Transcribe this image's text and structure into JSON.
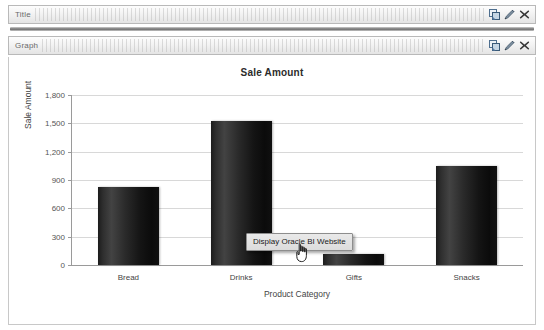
{
  "sections": [
    {
      "label": "Title",
      "icons": [
        {
          "name": "duplicate-icon",
          "title": "Duplicate"
        },
        {
          "name": "pencil-icon",
          "title": "Edit"
        },
        {
          "name": "close-icon",
          "title": "Delete"
        }
      ]
    },
    {
      "label": "Graph",
      "icons": [
        {
          "name": "duplicate-icon",
          "title": "Duplicate"
        },
        {
          "name": "pencil-icon",
          "title": "Edit"
        },
        {
          "name": "close-icon",
          "title": "Delete"
        }
      ]
    }
  ],
  "tooltip": {
    "text": "Display Oracle BI Website"
  },
  "colors": {
    "bar": "#1c1c1c",
    "gridline": "#d8d8d8",
    "axis": "#9a9a9a",
    "bar_header_border": "#b9b9b9",
    "tooltip_background": "#dcdcdc",
    "icon_blue": "#5b7fa6",
    "icon_dark": "#3a3a3a"
  },
  "chart_data": {
    "type": "bar",
    "title": "Sale Amount",
    "xlabel": "Product Category",
    "ylabel": "Sale Amount",
    "categories": [
      "Bread",
      "Drinks",
      "Gifts",
      "Snacks"
    ],
    "values": [
      830,
      1530,
      115,
      1050
    ],
    "ylim": [
      0,
      1800
    ],
    "yticks": [
      0,
      300,
      600,
      900,
      1200,
      1500,
      1800
    ],
    "ytick_labels": [
      "0",
      "300",
      "600",
      "900",
      "1,200",
      "1,500",
      "1,800"
    ],
    "grid": true,
    "legend": null
  }
}
